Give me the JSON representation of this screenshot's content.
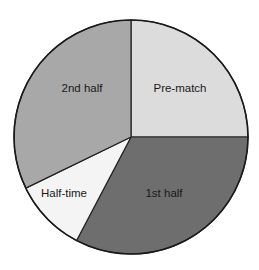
{
  "chart_data": {
    "type": "pie",
    "title": "",
    "start_angle_deg": 0,
    "direction": "clockwise",
    "center": [
      131,
      137
    ],
    "radius": 117,
    "categories": [
      "Pre-match",
      "1st half",
      "Half-time",
      "2nd half"
    ],
    "values": [
      25,
      32.7,
      10.1,
      32.2
    ],
    "unit": "%",
    "colors": [
      "#dcdcdc",
      "#6e6e6e",
      "#f4f4f4",
      "#a8a8a8"
    ],
    "label_positions": [
      [
        180,
        89
      ],
      [
        164,
        194
      ],
      [
        64,
        194
      ],
      [
        82,
        89
      ]
    ],
    "legend": "none (labels inside slices)",
    "edge_color": "#222222"
  }
}
